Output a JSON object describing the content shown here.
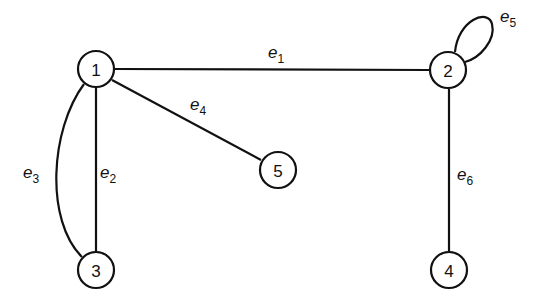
{
  "diagram": {
    "type": "graph",
    "nodes": [
      {
        "id": "1",
        "label": "1",
        "x": 96,
        "y": 69
      },
      {
        "id": "2",
        "label": "2",
        "x": 448,
        "y": 70
      },
      {
        "id": "3",
        "label": "3",
        "x": 96,
        "y": 270
      },
      {
        "id": "4",
        "label": "4",
        "x": 449,
        "y": 270
      },
      {
        "id": "5",
        "label": "5",
        "x": 278,
        "y": 170
      }
    ],
    "edges": [
      {
        "id": "e1",
        "name": "e",
        "sub": "1",
        "from": "1",
        "to": "2"
      },
      {
        "id": "e2",
        "name": "e",
        "sub": "2",
        "from": "1",
        "to": "3"
      },
      {
        "id": "e3",
        "name": "e",
        "sub": "3",
        "from": "1",
        "to": "3",
        "curved": true
      },
      {
        "id": "e4",
        "name": "e",
        "sub": "4",
        "from": "1",
        "to": "5"
      },
      {
        "id": "e5",
        "name": "e",
        "sub": "5",
        "from": "2",
        "to": "2",
        "loop": true
      },
      {
        "id": "e6",
        "name": "e",
        "sub": "6",
        "from": "2",
        "to": "4"
      }
    ]
  }
}
